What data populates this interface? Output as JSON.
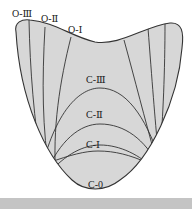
{
  "diagram": {
    "type": "schematic cross-section of zoned region (outer O-zones and concentric C-zones)",
    "fill_color": "#d7d7d7",
    "line_color": "#333333",
    "outer_labels": [
      "O-Ⅲ",
      "O-Ⅱ",
      "O-Ⅰ"
    ],
    "inner_labels": [
      "C-Ⅲ",
      "C-Ⅱ",
      "C-Ⅰ",
      "C-0"
    ]
  },
  "labels": {
    "o3": "O-Ⅲ",
    "o2": "O-Ⅱ",
    "o1": "O-Ⅰ",
    "c3": "C-Ⅲ",
    "c2": "C-Ⅱ",
    "c1": "C-Ⅰ",
    "c0": "C-0"
  },
  "footer_bar_color": "#c4c4c4"
}
